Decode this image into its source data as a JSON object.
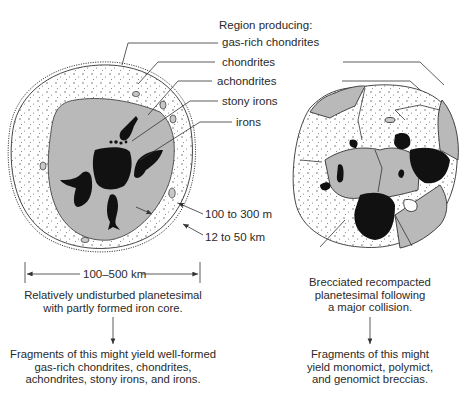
{
  "labels": {
    "region_line1": "Region producing:",
    "region_line2": "gas-rich chondrites",
    "chondrites": "chondrites",
    "achondrites": "achondrites",
    "stony_irons": "stony irons",
    "irons": "irons",
    "thickness_inner": "100 to 300 m",
    "thickness_outer": "12 to 50 km",
    "diameter": "100–500 km"
  },
  "left_panel": {
    "caption": [
      "Relatively undisturbed planetesimal",
      "with partly formed iron core."
    ],
    "result": [
      "Fragments of this might yield well-formed",
      "gas-rich chondrites, chondrites,",
      "achondrites, stony irons, and irons."
    ]
  },
  "right_panel": {
    "caption": [
      "Brecciated recompacted",
      "planetesimal following",
      "a major collision."
    ],
    "result": [
      "Fragments of this might",
      "yield monomict, polymict,",
      "and genomict breccias."
    ]
  },
  "colors": {
    "mantle_gray": "#b9b9b9",
    "core_black": "#111111",
    "regolith_white": "#ffffff",
    "line": "#333333"
  }
}
